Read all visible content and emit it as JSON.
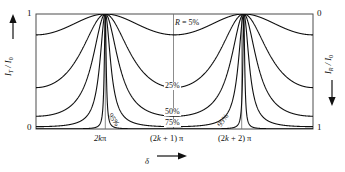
{
  "figure": {
    "background_color": "#ffffff",
    "line_color": "#111111",
    "frame_color": "#555555"
  },
  "axes": {
    "left": {
      "label_html": "I_T / I_0",
      "label_main": "I",
      "label_sub1": "T",
      "label_mid": " / I",
      "label_sub2": "0",
      "arrow_direction": "up",
      "top_value": "1",
      "bottom_value": "0"
    },
    "right": {
      "label_main": "I",
      "label_sub1": "R",
      "label_mid": " / I",
      "label_sub2": "0",
      "arrow_direction": "down",
      "top_value": "0",
      "bottom_value": "1"
    },
    "bottom": {
      "title": "δ",
      "arrow_direction": "right",
      "tick_labels": [
        "2kπ",
        "(2k + 1) π",
        "(2k + 2) π"
      ]
    }
  },
  "curve_labels": [
    {
      "text": "R = 5%",
      "italic_prefix": "R",
      "rest": " = 5%"
    },
    {
      "text": "25%"
    },
    {
      "text": "50%"
    },
    {
      "text": "75%"
    },
    {
      "text": "95%"
    },
    {
      "text": "95%"
    }
  ],
  "chart_data": {
    "type": "line",
    "title": "",
    "subtitle": "",
    "xlabel": "δ",
    "ylabel": "I_T / I_0",
    "y2label": "I_R / I_0",
    "xlim": [
      -3.14159265,
      9.42477796
    ],
    "ylim": [
      0,
      1
    ],
    "y2lim": [
      1,
      0
    ],
    "grid": false,
    "legend": "inline-curve-labels",
    "xtick_values": [
      0,
      3.14159265,
      6.28318531
    ],
    "xtick_labels": [
      "2kπ",
      "(2k + 1) π",
      "(2k + 2) π"
    ],
    "ytick_values": [
      0,
      1
    ],
    "ytick_labels": [
      "0",
      "1"
    ],
    "y2tick_labels": [
      "1",
      "0"
    ],
    "function": "Airy transmission: I_T/I_0 = 1 / (1 + F sin^2(delta/2)), F = 4R/(1-R)^2",
    "series": [
      {
        "name": "R = 5%",
        "R": 0.05,
        "finesse_F": 0.2216,
        "min_value": 0.818,
        "max_value": 1.0,
        "label": "R = 5%"
      },
      {
        "name": "25%",
        "R": 0.25,
        "finesse_F": 1.7778,
        "min_value": 0.36,
        "max_value": 1.0,
        "label": "25%"
      },
      {
        "name": "50%",
        "R": 0.5,
        "finesse_F": 8.0,
        "min_value": 0.111,
        "max_value": 1.0,
        "label": "50%"
      },
      {
        "name": "75%",
        "R": 0.75,
        "finesse_F": 48.0,
        "min_value": 0.0204,
        "max_value": 1.0,
        "label": "75%"
      },
      {
        "name": "95%",
        "R": 0.95,
        "finesse_F": 1520.0,
        "min_value": 0.00066,
        "max_value": 1.0,
        "label": "95%"
      }
    ],
    "annotations": [
      {
        "text": "R = 5%",
        "x": 2.55,
        "y": 0.925
      },
      {
        "text": "25%",
        "x": 3.14159265,
        "y": 0.4
      },
      {
        "text": "50%",
        "x": 3.14159265,
        "y": 0.175
      },
      {
        "text": "75%",
        "x": 3.14159265,
        "y": 0.075
      },
      {
        "text": "95%",
        "x": 0.62,
        "y": 0.075
      },
      {
        "text": "95%",
        "x": 5.66,
        "y": 0.075
      }
    ]
  }
}
